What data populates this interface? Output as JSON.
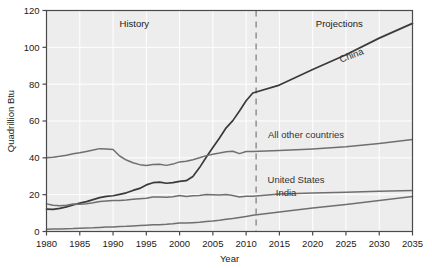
{
  "chart_data": {
    "type": "line",
    "title": "",
    "xlabel": "Year",
    "ylabel": "Quadrillion Btu",
    "xlim": [
      1980,
      2035
    ],
    "ylim": [
      0,
      120
    ],
    "ytick_step": 20,
    "xtick_step": 5,
    "grid": true,
    "legend_position": "inline-labels",
    "xticks": [
      "1980",
      "1985",
      "1990",
      "1995",
      "2000",
      "2005",
      "2010",
      "2015",
      "2020",
      "2025",
      "2030",
      "2035"
    ],
    "yticks": [
      "0",
      "20",
      "40",
      "60",
      "80",
      "100",
      "120"
    ],
    "annotations": [
      {
        "name": "history",
        "text": "History",
        "x": 1993.2,
        "y": 113
      },
      {
        "name": "projections",
        "text": "Projections",
        "x": 2024.0,
        "y": 113
      },
      {
        "name": "divider",
        "text": "",
        "x": 2011.5,
        "y": 0,
        "style": "dashed-vertical"
      }
    ],
    "divider_year": 2011.5,
    "series": [
      {
        "name": "China",
        "label": "China",
        "label_x": 2026.0,
        "label_y": 94,
        "label_rotation": -21,
        "color": "#3a3a3a",
        "x": [
          1980,
          1981,
          1982,
          1983,
          1984,
          1985,
          1986,
          1987,
          1988,
          1989,
          1990,
          1991,
          1992,
          1993,
          1994,
          1995,
          1996,
          1997,
          1998,
          1999,
          2000,
          2001,
          2002,
          2003,
          2004,
          2005,
          2006,
          2007,
          2008,
          2009,
          2010,
          2011,
          2015,
          2020,
          2025,
          2030,
          2035
        ],
        "values": [
          12.2,
          12.0,
          12.6,
          13.4,
          14.4,
          15.4,
          16.2,
          17.3,
          18.4,
          19.1,
          19.4,
          20.2,
          21.0,
          22.3,
          23.4,
          25.3,
          26.5,
          26.8,
          26.2,
          26.5,
          27.2,
          27.6,
          29.9,
          34.7,
          40.3,
          45.6,
          50.8,
          56.3,
          60.2,
          65.4,
          71.0,
          75.2,
          79.5,
          88.0,
          96.0,
          105.0,
          113.0
        ]
      },
      {
        "name": "All other countries",
        "label": "All other countries",
        "label_x": 2019.0,
        "label_y": 51,
        "label_rotation": 0,
        "color": "#6f6f6f",
        "x": [
          1980,
          1981,
          1982,
          1983,
          1984,
          1985,
          1986,
          1987,
          1988,
          1989,
          1990,
          1991,
          1992,
          1993,
          1994,
          1995,
          1996,
          1997,
          1998,
          1999,
          2000,
          2001,
          2002,
          2003,
          2004,
          2005,
          2006,
          2007,
          2008,
          2009,
          2010,
          2011,
          2015,
          2020,
          2025,
          2030,
          2035
        ],
        "values": [
          40.0,
          40.3,
          40.8,
          41.4,
          42.2,
          42.8,
          43.5,
          44.2,
          45.0,
          44.8,
          44.5,
          41.0,
          38.8,
          37.3,
          36.3,
          35.8,
          36.4,
          36.5,
          35.9,
          36.6,
          37.8,
          38.2,
          39.0,
          40.0,
          41.2,
          42.0,
          42.6,
          43.3,
          43.6,
          42.3,
          43.4,
          43.5,
          44.0,
          44.8,
          46.0,
          47.8,
          50.0
        ]
      },
      {
        "name": "United States",
        "label": "United States",
        "label_x": 2017.5,
        "label_y": 26.5,
        "label_rotation": 0,
        "color": "#6f6f6f",
        "x": [
          1980,
          1981,
          1982,
          1983,
          1984,
          1985,
          1986,
          1987,
          1988,
          1989,
          1990,
          1991,
          1992,
          1993,
          1994,
          1995,
          1996,
          1997,
          1998,
          1999,
          2000,
          2001,
          2002,
          2003,
          2004,
          2005,
          2006,
          2007,
          2008,
          2009,
          2010,
          2011,
          2015,
          2020,
          2025,
          2030,
          2035
        ],
        "values": [
          15.0,
          14.3,
          14.0,
          14.3,
          14.9,
          14.8,
          15.1,
          15.6,
          16.3,
          16.6,
          16.9,
          16.8,
          17.1,
          17.5,
          17.8,
          18.1,
          18.7,
          18.8,
          18.6,
          18.9,
          19.6,
          19.0,
          19.4,
          19.5,
          20.1,
          20.0,
          19.8,
          20.1,
          19.5,
          18.7,
          19.2,
          19.2,
          20.4,
          20.9,
          21.3,
          21.8,
          22.2
        ]
      },
      {
        "name": "India",
        "label": "India",
        "label_x": 2016.0,
        "label_y": 19.5,
        "label_rotation": 0,
        "color": "#6f6f6f",
        "x": [
          1980,
          1981,
          1982,
          1983,
          1984,
          1985,
          1986,
          1987,
          1988,
          1989,
          1990,
          1991,
          1992,
          1993,
          1994,
          1995,
          1996,
          1997,
          1998,
          1999,
          2000,
          2001,
          2002,
          2003,
          2004,
          2005,
          2006,
          2007,
          2008,
          2009,
          2010,
          2011,
          2015,
          2020,
          2025,
          2030,
          2035
        ],
        "values": [
          1.2,
          1.3,
          1.4,
          1.5,
          1.6,
          1.8,
          1.9,
          2.0,
          2.2,
          2.4,
          2.5,
          2.7,
          2.8,
          3.0,
          3.2,
          3.4,
          3.6,
          3.7,
          3.9,
          4.2,
          4.6,
          4.6,
          4.8,
          5.0,
          5.4,
          5.7,
          6.1,
          6.6,
          7.0,
          7.6,
          8.2,
          8.8,
          10.6,
          12.7,
          14.7,
          16.8,
          19.0
        ]
      }
    ]
  },
  "axes": {
    "ylabel": "Quadrillion Btu",
    "xlabel": "Year"
  }
}
